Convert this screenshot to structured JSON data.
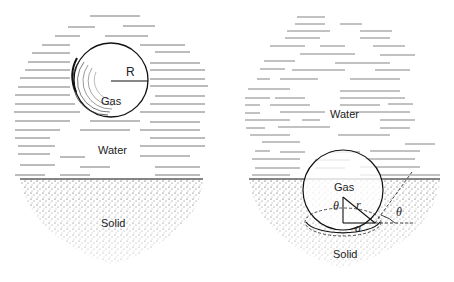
{
  "figure": {
    "left_panel": {
      "title": "Spherical gas bubble in water",
      "labels": {
        "radius": "R",
        "bubble_medium": "Gas",
        "liquid": "Water",
        "substrate": "Solid"
      }
    },
    "right_panel": {
      "title": "Gas cavity at water–solid interface",
      "labels": {
        "cavity_medium": "Gas",
        "liquid": "Water",
        "substrate": "Solid",
        "radius": "r",
        "base_radius": "a",
        "angle_inner": "θ",
        "angle_contact": "θ"
      }
    }
  }
}
